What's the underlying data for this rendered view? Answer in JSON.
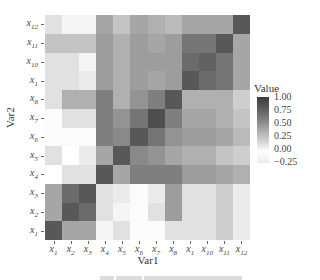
{
  "chart_data": {
    "type": "heatmap",
    "title": "",
    "xlabel": "Var1",
    "ylabel": "Var2",
    "x_categories": [
      "x1",
      "x2",
      "x3",
      "x4",
      "x5",
      "x6",
      "x7",
      "x8",
      "x1",
      "x10",
      "x11",
      "x12"
    ],
    "y_categories_top_to_bottom": [
      "x12",
      "x11",
      "x10",
      "x1",
      "x8",
      "x7",
      "x6",
      "x5",
      "x4",
      "x3",
      "x2",
      "x1"
    ],
    "values_rows_top_to_bottom": [
      [
        0.15,
        0.05,
        0.05,
        0.45,
        0.3,
        0.45,
        0.4,
        0.35,
        0.45,
        0.45,
        0.45,
        0.85
      ],
      [
        0.3,
        0.3,
        0.3,
        0.5,
        0.4,
        0.5,
        0.45,
        0.5,
        0.7,
        0.7,
        0.85,
        0.45
      ],
      [
        0.15,
        0.15,
        0.05,
        0.5,
        0.4,
        0.5,
        0.5,
        0.5,
        0.75,
        0.8,
        0.7,
        0.45
      ],
      [
        0.15,
        0.15,
        0.1,
        0.5,
        0.4,
        0.5,
        0.45,
        0.5,
        0.85,
        0.75,
        0.7,
        0.45
      ],
      [
        0.15,
        0.4,
        0.4,
        0.65,
        0.4,
        0.55,
        0.65,
        0.85,
        0.4,
        0.4,
        0.4,
        0.25
      ],
      [
        -0.05,
        0.15,
        0.15,
        0.65,
        0.55,
        0.7,
        0.9,
        0.65,
        0.45,
        0.45,
        0.4,
        0.3
      ],
      [
        -0.05,
        -0.05,
        -0.05,
        0.65,
        0.6,
        0.85,
        0.7,
        0.55,
        0.5,
        0.5,
        0.45,
        0.35
      ],
      [
        0.15,
        0.0,
        0.1,
        0.45,
        0.85,
        0.6,
        0.55,
        0.45,
        0.4,
        0.4,
        0.3,
        0.25
      ],
      [
        0.0,
        0.15,
        0.15,
        0.85,
        0.45,
        0.65,
        0.65,
        0.65,
        0.5,
        0.5,
        0.45,
        0.4
      ],
      [
        0.45,
        0.75,
        0.85,
        0.15,
        0.1,
        -0.05,
        0.1,
        0.5,
        0.15,
        0.15,
        0.25,
        0.1
      ],
      [
        0.45,
        0.85,
        0.75,
        0.15,
        0.05,
        -0.05,
        0.15,
        0.5,
        0.15,
        0.15,
        0.25,
        0.1
      ],
      [
        0.85,
        0.45,
        0.45,
        0.05,
        0.15,
        -0.05,
        -0.05,
        0.15,
        0.15,
        0.15,
        0.25,
        0.1
      ]
    ],
    "legend": {
      "title": "Value",
      "ticks": [
        "1.00",
        "0.75",
        "0.50",
        "0.25",
        "0.00",
        "-0.25"
      ],
      "range": [
        -0.25,
        1.0
      ],
      "colors": {
        "high": "#3a3a3a",
        "mid": "#b5b5b5",
        "zero": "#ffffff",
        "low": "#ececec"
      }
    },
    "grid": false,
    "legend_position": "right"
  },
  "axis": {
    "x_title": "Var1",
    "y_title": "Var2",
    "x_ticks": [
      {
        "base": "x",
        "sub": "1"
      },
      {
        "base": "x",
        "sub": "2"
      },
      {
        "base": "x",
        "sub": "3"
      },
      {
        "base": "x",
        "sub": "4"
      },
      {
        "base": "x",
        "sub": "5"
      },
      {
        "base": "x",
        "sub": "6"
      },
      {
        "base": "x",
        "sub": "7"
      },
      {
        "base": "x",
        "sub": "8"
      },
      {
        "base": "x",
        "sub": "1"
      },
      {
        "base": "x",
        "sub": "10"
      },
      {
        "base": "x",
        "sub": "11"
      },
      {
        "base": "x",
        "sub": "12"
      }
    ],
    "y_ticks_top_to_bottom": [
      {
        "base": "x",
        "sub": "12"
      },
      {
        "base": "x",
        "sub": "11"
      },
      {
        "base": "x",
        "sub": "10"
      },
      {
        "base": "x",
        "sub": "1"
      },
      {
        "base": "x",
        "sub": "8"
      },
      {
        "base": "x",
        "sub": "7"
      },
      {
        "base": "x",
        "sub": "6"
      },
      {
        "base": "x",
        "sub": "5"
      },
      {
        "base": "x",
        "sub": "4"
      },
      {
        "base": "x",
        "sub": "3"
      },
      {
        "base": "x",
        "sub": "2"
      },
      {
        "base": "x",
        "sub": "1"
      }
    ]
  },
  "legend": {
    "title": "Value",
    "labels": [
      "1.00",
      "0.75",
      "0.50",
      "0.25",
      "0.00",
      "−0.25"
    ]
  }
}
